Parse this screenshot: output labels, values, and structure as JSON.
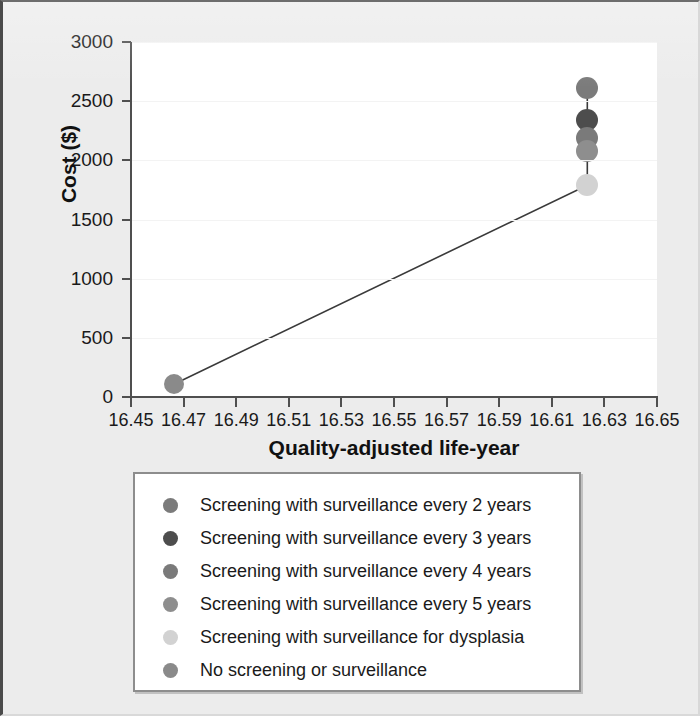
{
  "chart_data": {
    "type": "scatter",
    "title": "",
    "xlabel": "Quality-adjusted life-year",
    "ylabel": "Cost ($)",
    "xlim": [
      16.45,
      16.65
    ],
    "ylim": [
      0,
      3000
    ],
    "xticks": [
      "16.45",
      "16.47",
      "16.49",
      "16.51",
      "16.53",
      "16.55",
      "16.57",
      "16.59",
      "16.61",
      "16.63",
      "16.65"
    ],
    "xtick_values": [
      16.45,
      16.47,
      16.49,
      16.51,
      16.53,
      16.55,
      16.57,
      16.59,
      16.61,
      16.63,
      16.65
    ],
    "yticks": [
      "0",
      "500",
      "1000",
      "1500",
      "2000",
      "2500",
      "3000"
    ],
    "ytick_values": [
      0,
      500,
      1000,
      1500,
      2000,
      2500,
      3000
    ],
    "grid": true,
    "legend_position": "below-plot",
    "points": [
      {
        "label": "Screening with surveillance every 2 years",
        "x": 16.6235,
        "y": 2610,
        "color": "#7b7b7b",
        "radius": 11
      },
      {
        "label": "Screening with surveillance every 3 years",
        "x": 16.6235,
        "y": 2340,
        "color": "#4d4d4d",
        "radius": 11
      },
      {
        "label": "Screening with surveillance every 4 years",
        "x": 16.6235,
        "y": 2185,
        "color": "#7a7a7a",
        "radius": 11
      },
      {
        "label": "Screening with surveillance every 5 years",
        "x": 16.6235,
        "y": 2080,
        "color": "#8e8e8e",
        "radius": 11
      },
      {
        "label": "Screening with surveillance for dysplasia",
        "x": 16.6235,
        "y": 1790,
        "color": "#d2d2d2",
        "radius": 11
      },
      {
        "label": "No screening or surveillance",
        "x": 16.4665,
        "y": 110,
        "color": "#8a8a8a",
        "radius": 10
      }
    ],
    "efficiency_frontier": {
      "description": "line connecting points",
      "stroke": "#3a3a3a",
      "path": [
        {
          "x": 16.4665,
          "y": 110
        },
        {
          "x": 16.6235,
          "y": 1790
        },
        {
          "x": 16.6235,
          "y": 2080
        },
        {
          "x": 16.6235,
          "y": 2185
        },
        {
          "x": 16.6235,
          "y": 2340
        },
        {
          "x": 16.6235,
          "y": 2610
        }
      ]
    }
  },
  "legend": {
    "items": [
      {
        "label": "Screening with surveillance every 2 years",
        "color": "#7b7b7b"
      },
      {
        "label": "Screening with surveillance every 3 years",
        "color": "#4d4d4d"
      },
      {
        "label": "Screening with surveillance every 4 years",
        "color": "#7a7a7a"
      },
      {
        "label": "Screening with surveillance every 5 years",
        "color": "#8e8e8e"
      },
      {
        "label": "Screening with surveillance for dysplasia",
        "color": "#d2d2d2"
      },
      {
        "label": "No screening or surveillance",
        "color": "#8a8a8a"
      }
    ]
  },
  "colors": {
    "figure_background": "#ececec",
    "plot_background": "#ffffff",
    "axis": "#4f4f4f",
    "gridline": "#f3f3f3",
    "text": "#1a1a1a"
  }
}
